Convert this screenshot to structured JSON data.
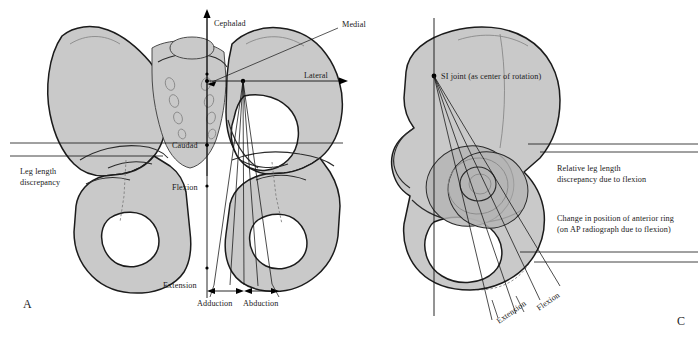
{
  "figure": {
    "background_color": "#ffffff",
    "bone_fill_color": "#c9c9c9",
    "outline_color": "#1b1b1b"
  },
  "panel_a": {
    "panel_label": "A",
    "labels": {
      "cephalad": "Cephalad",
      "caudad": "Caudad",
      "medial": "Medial",
      "lateral": "Lateral",
      "flexion": "Flexion",
      "extension": "Extension",
      "adduction": "Adduction",
      "abduction": "Abduction",
      "leg_length_line1": "Leg length",
      "leg_length_line2": "discrepancy"
    }
  },
  "panel_c": {
    "panel_label": "C",
    "labels": {
      "si_joint": "SI joint (as center of rotation)",
      "relative_lld_line1": "Relative leg length",
      "relative_lld_line2": "discrepancy due to flexion",
      "anterior_ring_line1": "Change in position of anterior ring",
      "anterior_ring_line2": "(on AP radiograph due to flexion)",
      "extension": "Extension",
      "flexion": "Flexion"
    }
  }
}
